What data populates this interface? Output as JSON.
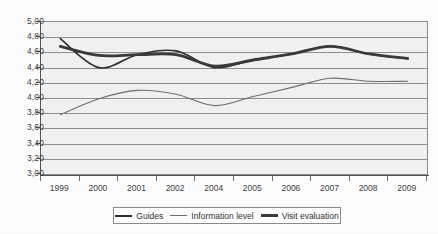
{
  "chart_data": {
    "type": "line",
    "title": "",
    "xlabel": "",
    "ylabel": "",
    "ylim": [
      3.0,
      5.0
    ],
    "ytick_step": 0.2,
    "grid": true,
    "legend_position": "bottom",
    "decimal_separator": ",",
    "categories": [
      "1999",
      "2000",
      "2001",
      "2002",
      "2004",
      "2005",
      "2006",
      "2007",
      "2008",
      "2009"
    ],
    "ytick_labels": [
      "5,00",
      "4,80",
      "4,60",
      "4,40",
      "4,20",
      "4,00",
      "3,80",
      "3,60",
      "3,40",
      "3,20",
      "3,00"
    ],
    "ytick_values": [
      5.0,
      4.8,
      4.6,
      4.4,
      4.2,
      4.0,
      3.8,
      3.6,
      3.4,
      3.2,
      3.0
    ],
    "series": [
      {
        "name": "Guides",
        "color": "#2f2f2f",
        "width": 1.6,
        "values": [
          4.78,
          4.4,
          4.57,
          4.62,
          4.4,
          4.5,
          4.58,
          4.68,
          4.58,
          4.52
        ]
      },
      {
        "name": "Information level",
        "color": "#6d6d6d",
        "width": 1.1,
        "values": [
          3.78,
          3.99,
          4.1,
          4.05,
          3.9,
          4.02,
          4.14,
          4.26,
          4.22,
          4.22
        ]
      },
      {
        "name": "Visit evaluation",
        "color": "#3a3a3a",
        "width": 2.8,
        "values": [
          4.68,
          4.56,
          4.57,
          4.57,
          4.42,
          4.5,
          4.58,
          4.68,
          4.58,
          4.52
        ]
      }
    ]
  },
  "legend": {
    "items": [
      {
        "label": "Guides"
      },
      {
        "label": "Information level"
      },
      {
        "label": "Visit evaluation"
      }
    ]
  }
}
